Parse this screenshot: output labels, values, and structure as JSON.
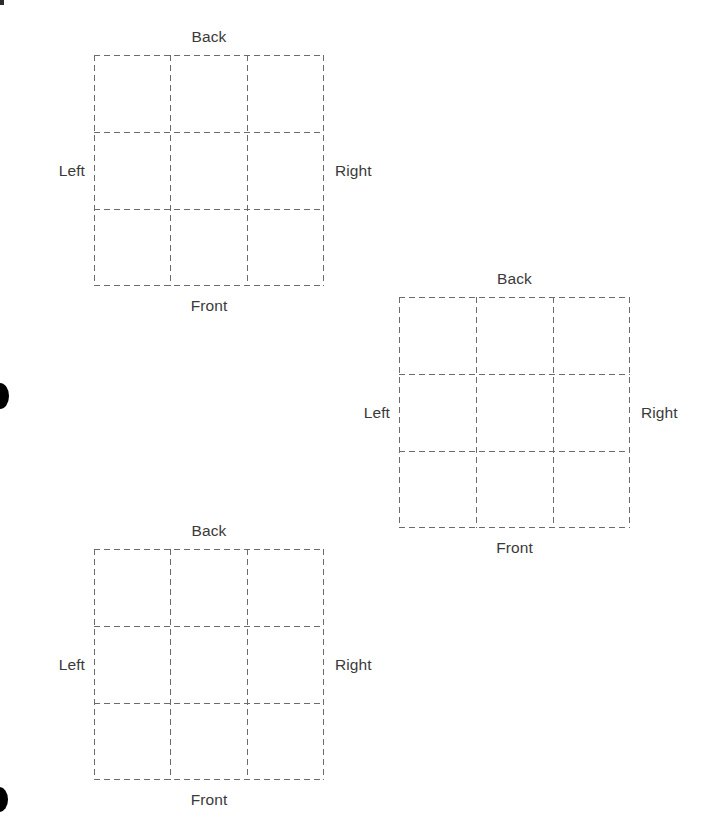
{
  "page": {
    "background_color": "#ffffff",
    "width": 721,
    "height": 827
  },
  "style": {
    "line_color": "#6b6b6b",
    "line_width": 1,
    "dash": "6 4",
    "text_color": "#3a3a3a",
    "font_size": "15.5px",
    "blob_color": "#000000"
  },
  "grids": [
    {
      "id": "grid-1",
      "x": 94,
      "y": 55,
      "width": 230,
      "height": 231,
      "rows": 3,
      "cols": 3,
      "labels": {
        "back": "Back",
        "front": "Front",
        "left": "Left",
        "right": "Right"
      },
      "cells": [
        [
          "",
          "",
          ""
        ],
        [
          "",
          "",
          ""
        ],
        [
          "",
          "",
          ""
        ]
      ]
    },
    {
      "id": "grid-2",
      "x": 399,
      "y": 297,
      "width": 231,
      "height": 231,
      "rows": 3,
      "cols": 3,
      "labels": {
        "back": "Back",
        "front": "Front",
        "left": "Left",
        "right": "Right"
      },
      "cells": [
        [
          "",
          "",
          ""
        ],
        [
          "",
          "",
          ""
        ],
        [
          "",
          "",
          ""
        ]
      ]
    },
    {
      "id": "grid-3",
      "x": 94,
      "y": 549,
      "width": 230,
      "height": 231,
      "rows": 3,
      "cols": 3,
      "labels": {
        "back": "Back",
        "front": "Front",
        "left": "Left",
        "right": "Right"
      },
      "cells": [
        [
          "",
          "",
          ""
        ],
        [
          "",
          "",
          ""
        ],
        [
          "",
          "",
          ""
        ]
      ]
    }
  ],
  "marks": [
    {
      "id": "blob-middle",
      "shape": "ellipse-clipped-left",
      "x": -9,
      "y": 383,
      "width": 18,
      "height": 26
    },
    {
      "id": "blob-bottom",
      "shape": "ellipse-clipped-left",
      "x": -9,
      "y": 787,
      "width": 17,
      "height": 25
    },
    {
      "id": "corner-speck",
      "shape": "rect",
      "x": 0,
      "y": 0,
      "width": 4,
      "height": 5
    }
  ]
}
